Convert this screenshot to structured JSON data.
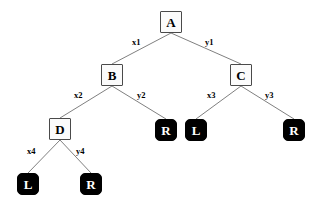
{
  "diagram": {
    "background_color": "#ffffff",
    "edge_color": "#808080",
    "internal_node_fill": "#fbfbfb",
    "internal_node_border": "#4a4a4a",
    "internal_node_text_color": "#000000",
    "leaf_node_fill": "#000000",
    "leaf_node_text_color": "#ffffff"
  },
  "nodes": [
    {
      "id": "A",
      "label": "A",
      "kind": "internal",
      "x": 160,
      "y": 11
    },
    {
      "id": "B",
      "label": "B",
      "kind": "internal",
      "x": 101,
      "y": 64
    },
    {
      "id": "C",
      "label": "C",
      "kind": "internal",
      "x": 230,
      "y": 64
    },
    {
      "id": "D",
      "label": "D",
      "kind": "internal",
      "x": 49,
      "y": 118
    },
    {
      "id": "R2",
      "label": "R",
      "kind": "leaf",
      "x": 155,
      "y": 119
    },
    {
      "id": "L3",
      "label": "L",
      "kind": "leaf",
      "x": 185,
      "y": 119
    },
    {
      "id": "R3",
      "label": "R",
      "kind": "leaf",
      "x": 283,
      "y": 119
    },
    {
      "id": "L4",
      "label": "L",
      "kind": "leaf",
      "x": 17,
      "y": 173
    },
    {
      "id": "R4",
      "label": "R",
      "kind": "leaf",
      "x": 80,
      "y": 173
    }
  ],
  "edges": [
    {
      "from": "A",
      "to": "B",
      "label": "x1",
      "x1": 171,
      "y1": 33,
      "x2": 112,
      "y2": 64,
      "lx": 132,
      "ly": 38
    },
    {
      "from": "A",
      "to": "C",
      "label": "y1",
      "x1": 171,
      "y1": 33,
      "x2": 241,
      "y2": 64,
      "lx": 205,
      "ly": 38
    },
    {
      "from": "B",
      "to": "D",
      "label": "x2",
      "x1": 112,
      "y1": 86,
      "x2": 60,
      "y2": 118,
      "lx": 74,
      "ly": 91
    },
    {
      "from": "B",
      "to": "R2",
      "label": "y2",
      "x1": 112,
      "y1": 86,
      "x2": 166,
      "y2": 119,
      "lx": 137,
      "ly": 91
    },
    {
      "from": "C",
      "to": "L3",
      "label": "x3",
      "x1": 241,
      "y1": 86,
      "x2": 196,
      "y2": 119,
      "lx": 207,
      "ly": 91
    },
    {
      "from": "C",
      "to": "R3",
      "label": "y3",
      "x1": 241,
      "y1": 86,
      "x2": 294,
      "y2": 119,
      "lx": 265,
      "ly": 91
    },
    {
      "from": "D",
      "to": "L4",
      "label": "x4",
      "x1": 60,
      "y1": 140,
      "x2": 28,
      "y2": 173,
      "lx": 27,
      "ly": 147
    },
    {
      "from": "D",
      "to": "R4",
      "label": "y4",
      "x1": 60,
      "y1": 140,
      "x2": 91,
      "y2": 173,
      "lx": 76,
      "ly": 147
    }
  ]
}
